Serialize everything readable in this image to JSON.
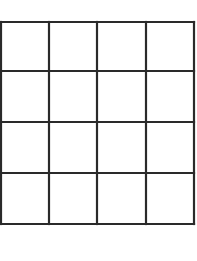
{
  "diagram": {
    "type": "grid",
    "rows": 4,
    "columns": 4,
    "line_color": "#2a2a2a",
    "background": "#ffffff",
    "x_lines": [
      1,
      49,
      97,
      146,
      194
    ],
    "y_lines": [
      22,
      71,
      122,
      173,
      224
    ],
    "stroke_width": 2.2
  }
}
